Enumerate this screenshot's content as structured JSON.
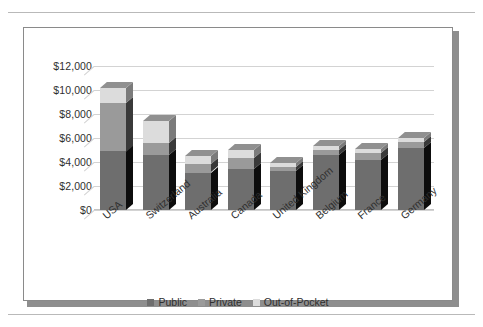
{
  "chart_data": {
    "type": "bar",
    "subtype": "stacked-column-3d",
    "title": "",
    "xlabel": "",
    "ylabel": "",
    "ylim": [
      0,
      12000
    ],
    "ytick_values": [
      0,
      2000,
      4000,
      6000,
      8000,
      10000,
      12000
    ],
    "ytick_labels": [
      "$0",
      "$2,000",
      "$4,000",
      "$6,000",
      "$8,000",
      "$10,000",
      "$12,000"
    ],
    "grid": true,
    "legend_position": "bottom",
    "categories": [
      "USA",
      "Switzerland",
      "Australia",
      "Canada",
      "United Kingdom",
      "Belgium",
      "France",
      "Germany"
    ],
    "series": [
      {
        "name": "Public",
        "color": "#6e6e6e",
        "values": [
          4900,
          4600,
          3100,
          3450,
          3250,
          4550,
          4150,
          5150
        ]
      },
      {
        "name": "Private",
        "color": "#9a9a9a",
        "values": [
          4050,
          1000,
          700,
          900,
          350,
          450,
          600,
          500
        ]
      },
      {
        "name": "Out-of-Pocket",
        "color": "#dcdcdc",
        "values": [
          1250,
          1800,
          700,
          650,
          300,
          300,
          350,
          350
        ]
      }
    ],
    "totals": [
      10200,
      7400,
      4500,
      5000,
      3900,
      5300,
      5100,
      6000
    ]
  },
  "legend": {
    "items": [
      {
        "label": "Public"
      },
      {
        "label": "Private"
      },
      {
        "label": "Out-of-Pocket"
      }
    ]
  },
  "colors": {
    "public": "#6e6e6e",
    "private": "#9a9a9a",
    "out_of_pocket": "#dcdcdc",
    "grid": "#d3d3d3",
    "frame": "#8a8a8a",
    "text": "#2f2f2f"
  }
}
